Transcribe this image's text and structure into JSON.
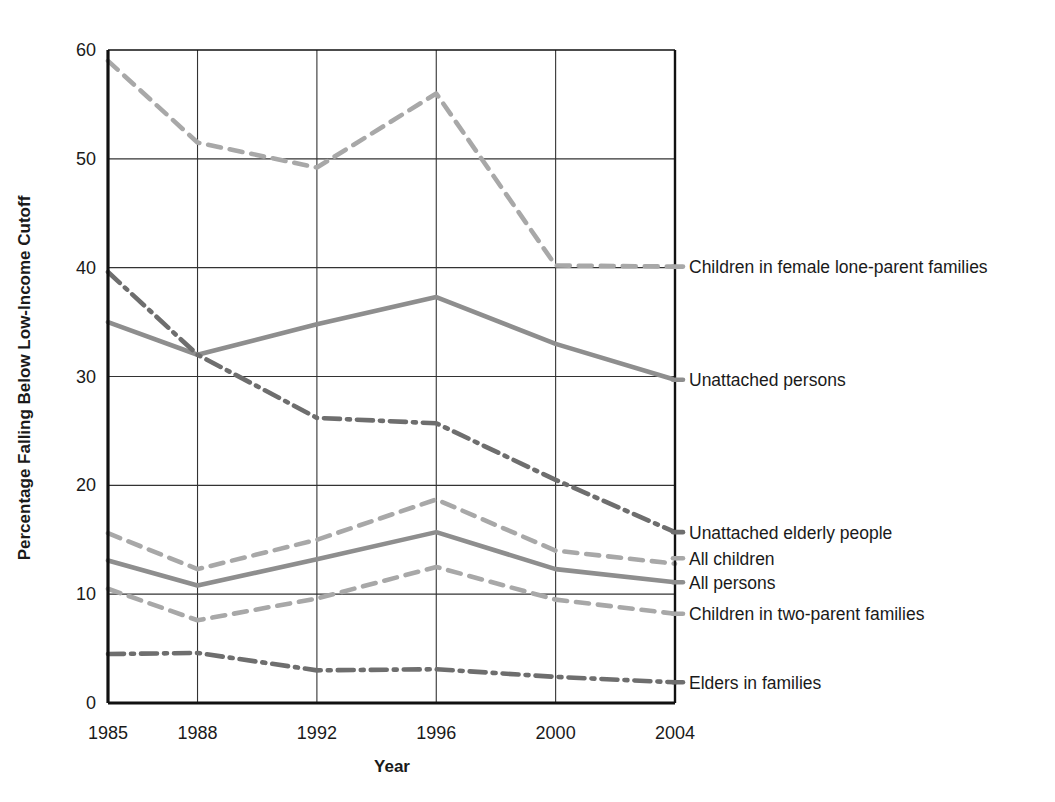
{
  "chart_data": {
    "type": "line",
    "title": "",
    "xlabel": "Year",
    "ylabel": "Percentage Falling Below Low-Income Cutoff",
    "x": [
      1985,
      1988,
      1992,
      1996,
      2000,
      2004
    ],
    "xticklabels": [
      "1985",
      "1988",
      "1992",
      "1996",
      "2000",
      "2004"
    ],
    "yticks": [
      0,
      10,
      20,
      30,
      40,
      50,
      60
    ],
    "yticklabels": [
      "0",
      "10",
      "20",
      "30",
      "40",
      "50",
      "60"
    ],
    "ylim": [
      0,
      60
    ],
    "xlim": [
      1985,
      2004
    ],
    "grid": "both",
    "legend_position": "right-inline-labels",
    "series": [
      {
        "name": "Children in female lone-parent families",
        "values": [
          59.0,
          51.5,
          49.2,
          56.0,
          40.2,
          40.1
        ],
        "style": "dashed",
        "color": "#a8a8a8",
        "label_y": 40.1
      },
      {
        "name": "Unattached persons",
        "values": [
          35.0,
          32.0,
          34.8,
          37.3,
          33.0,
          29.7
        ],
        "style": "solid",
        "color": "#8e8e8e",
        "label_y": 29.7
      },
      {
        "name": "Unattached elderly people",
        "values": [
          39.6,
          32.0,
          26.2,
          25.7,
          20.5,
          15.7
        ],
        "style": "dashdot",
        "color": "#6e6e6e",
        "label_y": 15.7
      },
      {
        "name": "All children",
        "values": [
          15.6,
          12.3,
          15.0,
          18.7,
          14.0,
          12.8
        ],
        "style": "dashed",
        "color": "#a8a8a8",
        "label_y": 13.3
      },
      {
        "name": "All persons",
        "values": [
          13.1,
          10.8,
          13.2,
          15.7,
          12.3,
          11.1
        ],
        "style": "solid",
        "color": "#8e8e8e",
        "label_y": 11.1
      },
      {
        "name": "Children in two-parent families",
        "values": [
          10.5,
          7.6,
          9.6,
          12.5,
          9.5,
          8.2
        ],
        "style": "dashed",
        "color": "#a8a8a8",
        "label_y": 8.2
      },
      {
        "name": "Elders in families",
        "values": [
          4.5,
          4.6,
          3.0,
          3.1,
          2.4,
          1.9
        ],
        "style": "dashdot",
        "color": "#6e6e6e",
        "label_y": 1.9
      }
    ]
  }
}
